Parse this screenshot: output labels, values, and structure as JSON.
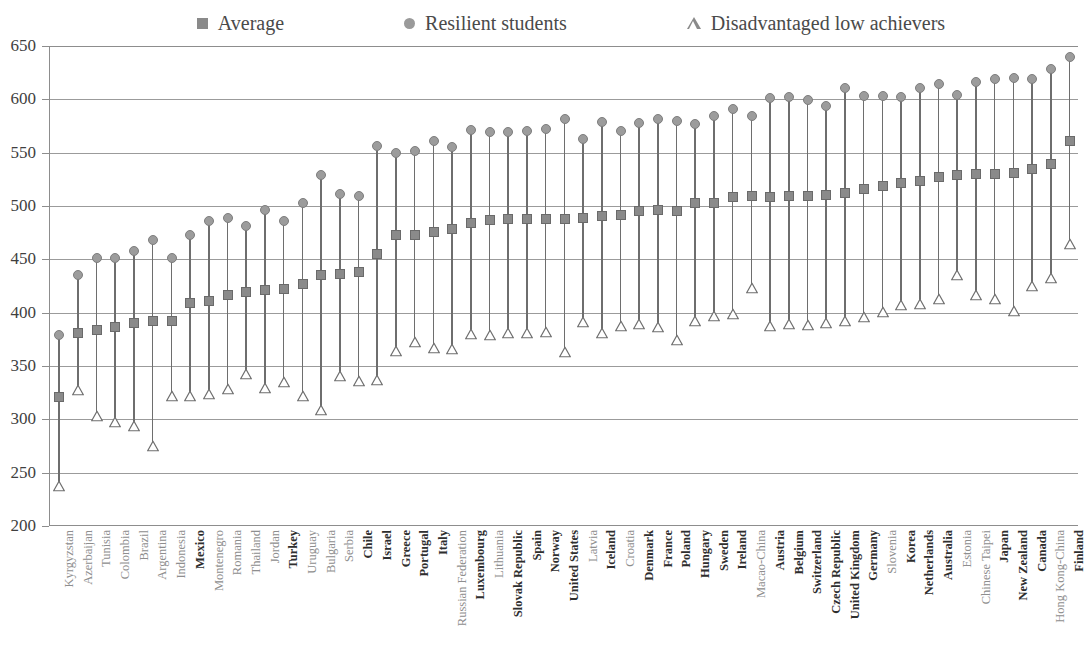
{
  "legend": {
    "items": [
      {
        "label": "Average",
        "marker": "square-marker-icon"
      },
      {
        "label": "Resilient students",
        "marker": "circle-marker-icon"
      },
      {
        "label": "Disadvantaged low achievers",
        "marker": "triangle-marker-icon"
      }
    ]
  },
  "colors": {
    "average": "#8a8a8a",
    "resilient": "#9c9c9c",
    "disadvantaged": "#8a8a8a",
    "stem": "#6e6e6e",
    "grid": "#9b9b9b",
    "axis": "#8d8d8d",
    "oecd_label": "#2e2e2e",
    "partner_label": "#8e8e8e"
  },
  "chart_data": {
    "type": "scatter",
    "title": "",
    "subtitle": "",
    "xlabel": "",
    "ylabel": "",
    "ylim": [
      200,
      650
    ],
    "yticks": [
      200,
      250,
      300,
      350,
      400,
      450,
      500,
      550,
      600,
      650
    ],
    "ytick_labels": [
      "200",
      "250",
      "300",
      "350",
      "400",
      "450",
      "500",
      "550",
      "600",
      "650"
    ],
    "grid": true,
    "legend_position": "top",
    "categories": [
      "Kyrgyzstan",
      "Azerbaijan",
      "Tunisia",
      "Colombia",
      "Brazil",
      "Argentina",
      "Indonesia",
      "Mexico",
      "Montenegro",
      "Romania",
      "Thailand",
      "Jordan",
      "Turkey",
      "Uruguay",
      "Bulgaria",
      "Serbia",
      "Chile",
      "Israel",
      "Greece",
      "Portugal",
      "Italy",
      "Russian Federation",
      "Luxembourg",
      "Lithuania",
      "Slovak Republic",
      "Spain",
      "Norway",
      "United States",
      "Latvia",
      "Iceland",
      "Croatia",
      "Denmark",
      "France",
      "Poland",
      "Hungary",
      "Sweden",
      "Ireland",
      "Macao-China",
      "Austria",
      "Belgium",
      "Switzerland",
      "Czech Republic",
      "United Kingdom",
      "Germany",
      "Slovenia",
      "Korea",
      "Netherlands",
      "Australia",
      "Estonia",
      "Chinese Taipei",
      "Japan",
      "New Zealand",
      "Canada",
      "Hong Kong-China",
      "Finland"
    ],
    "category_is_oecd": [
      false,
      false,
      false,
      false,
      false,
      false,
      false,
      true,
      false,
      false,
      false,
      false,
      true,
      false,
      false,
      false,
      true,
      true,
      true,
      true,
      true,
      false,
      true,
      false,
      true,
      true,
      true,
      true,
      false,
      true,
      false,
      true,
      true,
      true,
      true,
      true,
      true,
      false,
      true,
      true,
      true,
      true,
      true,
      true,
      false,
      true,
      true,
      true,
      false,
      false,
      true,
      true,
      true,
      false,
      true
    ],
    "series": [
      {
        "name": "Average",
        "marker": "square",
        "values": [
          321,
          381,
          384,
          387,
          390,
          392,
          392,
          409,
          411,
          417,
          419,
          421,
          422,
          427,
          435,
          436,
          438,
          455,
          473,
          473,
          476,
          478,
          484,
          487,
          488,
          488,
          488,
          488,
          489,
          491,
          492,
          495,
          496,
          495,
          503,
          503,
          508,
          509,
          508,
          509,
          509,
          510,
          512,
          516,
          519,
          522,
          523,
          527,
          529,
          530,
          530,
          531,
          535,
          539,
          561
        ]
      },
      {
        "name": "Resilient students",
        "marker": "circle",
        "values": [
          379,
          435,
          451,
          451,
          458,
          468,
          451,
          473,
          486,
          489,
          481,
          496,
          486,
          503,
          529,
          511,
          509,
          556,
          550,
          552,
          561,
          555,
          571,
          569,
          569,
          570,
          572,
          582,
          563,
          579,
          570,
          578,
          582,
          580,
          577,
          584,
          591,
          584,
          601,
          602,
          599,
          594,
          611,
          603,
          603,
          602,
          611,
          614,
          604,
          616,
          619,
          620,
          619,
          628,
          640
        ]
      },
      {
        "name": "Disadvantaged low achievers",
        "marker": "triangle",
        "values": [
          240,
          330,
          306,
          300,
          297,
          278,
          325,
          325,
          327,
          331,
          345,
          332,
          338,
          325,
          312,
          343,
          339,
          340,
          367,
          375,
          370,
          369,
          383,
          382,
          384,
          384,
          385,
          366,
          394,
          384,
          390,
          392,
          389,
          377,
          395,
          400,
          402,
          426,
          390,
          392,
          391,
          393,
          395,
          399,
          403,
          410,
          411,
          416,
          438,
          419,
          416,
          404,
          428,
          435,
          467
        ]
      }
    ]
  }
}
